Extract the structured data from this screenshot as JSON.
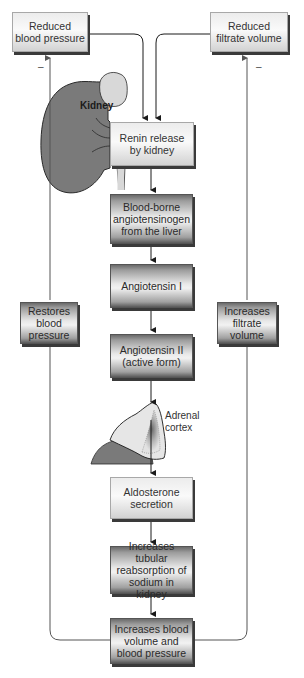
{
  "diagram": {
    "type": "flowchart",
    "top_boxes": {
      "left": "Reduced\nblood pressure",
      "right": "Reduced\nfiltrate volume"
    },
    "organ_labels": {
      "kidney": "Kidney",
      "adrenal": "Adrenal\ncortex"
    },
    "steps": [
      "Renin release\nby kidney",
      "Blood-borne\nangiotensinogen\nfrom the liver",
      "Angiotensin I",
      "Angiotensin II\n(active form)",
      "Aldosterone\nsecretion",
      "Increases tubular\nreabsorption of\nsodium in kidney",
      "Increases blood\nvolume and\nblood pressure"
    ],
    "feedback_boxes": {
      "left": "Restores\nblood\npressure",
      "right": "Increases\nfiltrate\nvolume"
    },
    "feedback_signs": {
      "left": "–",
      "right": "–"
    },
    "colors": {
      "arrow": "#1a1a1a",
      "feedback_line": "#555555",
      "kidney": "#7a7a7a",
      "adrenal_top": "#d8d8d8",
      "box_shadow": "#3a3a3a"
    }
  }
}
